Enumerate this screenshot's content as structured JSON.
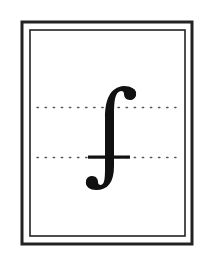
{
  "figure": {
    "glyph": "integral-with-crossbar",
    "glyph_char": "⨍",
    "colors": {
      "background": "#ffffff",
      "ink": "#111111",
      "frame": "#222222",
      "guide_dots": "#555555"
    },
    "frame": {
      "outer": {
        "x": 22,
        "y": 22,
        "width": 170,
        "height": 222,
        "stroke_width": 3
      },
      "inner": {
        "x": 30,
        "y": 30,
        "width": 155,
        "height": 206,
        "stroke_width": 1.6
      }
    },
    "guides": [
      {
        "name": "upper",
        "y": 107,
        "x_start": 36,
        "x_end": 175,
        "dot_spacing": 8
      },
      {
        "name": "lower",
        "y": 157,
        "x_start": 36,
        "x_end": 175,
        "dot_spacing": 8
      }
    ],
    "crossbar": {
      "x_start": 88,
      "x_end": 130,
      "y": 157,
      "thickness": 3
    }
  }
}
